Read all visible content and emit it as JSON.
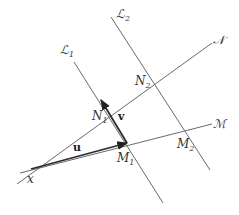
{
  "diagram": {
    "type": "geometry",
    "lines": [
      {
        "id": "L1",
        "label": "ℒ",
        "subscript": "1",
        "from": [
          74,
          62
        ],
        "to": [
          163,
          203
        ],
        "label_pos": [
          60,
          54
        ]
      },
      {
        "id": "L2",
        "label": "ℒ",
        "subscript": "2",
        "from": [
          111,
          17
        ],
        "to": [
          210,
          170
        ],
        "label_pos": [
          116,
          18
        ]
      },
      {
        "id": "N",
        "label": "𝒩",
        "from": [
          17,
          184
        ],
        "to": [
          212,
          43
        ],
        "label_pos": [
          213,
          44
        ]
      },
      {
        "id": "M",
        "label": "ℳ",
        "from": [
          20,
          173
        ],
        "to": [
          212,
          124
        ],
        "label_pos": [
          213,
          128
        ]
      }
    ],
    "points": [
      {
        "id": "x",
        "label": "x",
        "subscript": "",
        "pos": [
          31,
          169
        ],
        "label_pos": [
          27,
          183
        ]
      },
      {
        "id": "N1",
        "label": "N",
        "subscript": "1",
        "pos": [
          101,
          100
        ],
        "label_pos": [
          92,
          120
        ]
      },
      {
        "id": "M1",
        "label": "M",
        "subscript": "1",
        "pos": [
          127,
          143
        ],
        "label_pos": [
          117,
          162
        ]
      },
      {
        "id": "N2",
        "label": "N",
        "subscript": "2",
        "pos": [
          143,
          66
        ],
        "label_pos": [
          135,
          85
        ]
      },
      {
        "id": "M2",
        "label": "M",
        "subscript": "2",
        "pos": [
          187,
          128
        ],
        "label_pos": [
          177,
          148
        ]
      }
    ],
    "vectors": [
      {
        "id": "u",
        "label": "u",
        "from": [
          31,
          169
        ],
        "to": [
          127,
          143
        ],
        "label_pos": [
          73,
          151
        ]
      },
      {
        "id": "v",
        "label": "v",
        "from": [
          127,
          143
        ],
        "to": [
          101,
          100
        ],
        "label_pos": [
          118,
          120
        ]
      }
    ]
  }
}
